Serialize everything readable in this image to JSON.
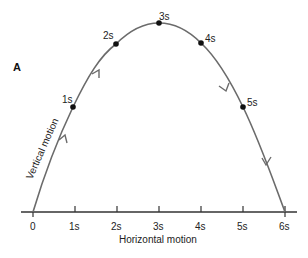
{
  "diagram": {
    "panel_label": "A",
    "x_axis_label": "Horizontal motion",
    "y_axis_label": "Vertical motion",
    "x_ticks": [
      "0",
      "1s",
      "2s",
      "3s",
      "4s",
      "5s",
      "6s"
    ],
    "points": [
      {
        "label": "1s"
      },
      {
        "label": "2s"
      },
      {
        "label": "3s"
      },
      {
        "label": "4s"
      },
      {
        "label": "5s"
      }
    ],
    "colors": {
      "curve": "#6b6b6b",
      "axis": "#333333",
      "point": "#111111",
      "text": "#222222"
    }
  }
}
